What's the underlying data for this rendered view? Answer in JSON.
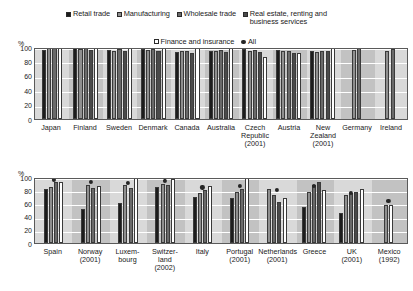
{
  "legend": {
    "row1": [
      {
        "label": "Retail trade",
        "swatch": "#1c1c1c",
        "marker": "square"
      },
      {
        "label": "Manufacturing",
        "swatch": "#8f8f8f",
        "marker": "square"
      },
      {
        "label": "Wholesale trade",
        "swatch": "#6a6a6a",
        "marker": "square"
      },
      {
        "label": "Real estate, renting and business services",
        "swatch": "#4a4a4a",
        "marker": "square"
      }
    ],
    "row2": [
      {
        "label": "Finance and insurance",
        "swatch": "#ffffff",
        "marker": "square"
      },
      {
        "label": "All",
        "swatch": "#262626",
        "marker": "dot"
      }
    ]
  },
  "chart_data": [
    {
      "type": "bar",
      "id": "chart-top",
      "title": "",
      "xlabel": "",
      "ylabel": "%",
      "ylim": [
        0,
        100
      ],
      "yticks": [
        0,
        20,
        40,
        60,
        80,
        100
      ],
      "grid": true,
      "legend_position": "top",
      "series": [
        {
          "name": "Retail trade",
          "color": "#1c1c1c",
          "values": [
            96,
            98,
            96,
            97,
            93,
            95,
            97,
            96,
            95,
            null,
            null
          ]
        },
        {
          "name": "Manufacturing",
          "color": "#8f8f8f",
          "values": [
            100,
            97,
            95,
            96,
            95,
            94,
            95,
            94,
            93,
            96,
            95
          ]
        },
        {
          "name": "Wholesale trade",
          "color": "#6a6a6a",
          "values": [
            99,
            99,
            97,
            97,
            94,
            96,
            96,
            95,
            95,
            98,
            97
          ]
        },
        {
          "name": "Real estate, renting and business services",
          "color": "#4a4a4a",
          "values": [
            null,
            96,
            94,
            95,
            92,
            93,
            93,
            92,
            94,
            null,
            null
          ]
        },
        {
          "name": "Finance and insurance",
          "color": "#ffffff",
          "values": [
            100,
            100,
            100,
            100,
            99,
            100,
            86,
            92,
            100,
            null,
            null
          ]
        }
      ],
      "all_marker": {
        "name": "All",
        "color": "#262626",
        "values": [
          100,
          99,
          97,
          97,
          95,
          96,
          96,
          95,
          96,
          97,
          97
        ]
      },
      "categories": [
        {
          "label": "Japan",
          "year": ""
        },
        {
          "label": "Finland",
          "year": ""
        },
        {
          "label": "Sweden",
          "year": ""
        },
        {
          "label": "Denmark",
          "year": ""
        },
        {
          "label": "Canada",
          "year": ""
        },
        {
          "label": "Australia",
          "year": ""
        },
        {
          "label": "Czech Republic",
          "year": "(2001)"
        },
        {
          "label": "Austria",
          "year": ""
        },
        {
          "label": "New Zealand",
          "year": "(2001)"
        },
        {
          "label": "Germany",
          "year": ""
        },
        {
          "label": "Ireland",
          "year": ""
        }
      ]
    },
    {
      "type": "bar",
      "id": "chart-bottom",
      "title": "",
      "xlabel": "",
      "ylabel": "%",
      "ylim": [
        0,
        100
      ],
      "yticks": [
        0,
        20,
        40,
        60,
        80,
        100
      ],
      "grid": true,
      "legend_position": "top",
      "series": [
        {
          "name": "Retail trade",
          "color": "#1c1c1c",
          "values": [
            82,
            52,
            60,
            85,
            70,
            68,
            null,
            55,
            46,
            null
          ]
        },
        {
          "name": "Manufacturing",
          "color": "#8f8f8f",
          "values": [
            85,
            88,
            88,
            90,
            76,
            78,
            82,
            78,
            72,
            57
          ]
        },
        {
          "name": "Wholesale trade",
          "color": "#6a6a6a",
          "values": [
            92,
            84,
            84,
            88,
            80,
            82,
            72,
            88,
            76,
            null
          ]
        },
        {
          "name": "Real estate, renting and business services",
          "color": "#4a4a4a",
          "values": [
            null,
            null,
            null,
            null,
            null,
            null,
            62,
            92,
            78,
            null
          ]
        },
        {
          "name": "Finance and insurance",
          "color": "#ffffff",
          "values": [
            93,
            86,
            100,
            97,
            86,
            100,
            68,
            80,
            82,
            57
          ]
        }
      ],
      "all_marker": {
        "name": "All",
        "color": "#262626",
        "values": [
          89,
          86,
          85,
          88,
          78,
          80,
          74,
          80,
          70,
          58
        ]
      },
      "categories": [
        {
          "label": "Spain",
          "year": ""
        },
        {
          "label": "Norway",
          "year": "(2001)"
        },
        {
          "label": "Luxem-bourg",
          "year": ""
        },
        {
          "label": "Switzer-land",
          "year": "(2002)"
        },
        {
          "label": "Italy",
          "year": ""
        },
        {
          "label": "Portugal",
          "year": "(2001)"
        },
        {
          "label": "Netherlands",
          "year": "(2001)"
        },
        {
          "label": "Greece",
          "year": ""
        },
        {
          "label": "UK",
          "year": "(2001)"
        },
        {
          "label": "Mexico",
          "year": "(1992)"
        }
      ]
    }
  ]
}
